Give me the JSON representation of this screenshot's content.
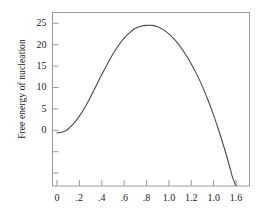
{
  "chart_data": {
    "type": "line",
    "title": "",
    "xlabel": "",
    "ylabel": "Free energy of nucleation",
    "xlim": [
      -0.04,
      1.72
    ],
    "ylim": [
      -13.0,
      27.5
    ],
    "grid": false,
    "legend": null,
    "x_ticks": [
      {
        "value": 0.0,
        "label": "0"
      },
      {
        "value": 0.2,
        "label": ".2"
      },
      {
        "value": 0.4,
        "label": ".4"
      },
      {
        "value": 0.6,
        "label": ".6"
      },
      {
        "value": 0.8,
        "label": ".8"
      },
      {
        "value": 1.0,
        "label": "1.0"
      },
      {
        "value": 1.2,
        "label": "1.2"
      },
      {
        "value": 1.4,
        "label": "1.0"
      },
      {
        "value": 1.6,
        "label": "1.6"
      }
    ],
    "y_ticks": [
      {
        "value": 25,
        "label": "25"
      },
      {
        "value": 20,
        "label": "20"
      },
      {
        "value": 15,
        "label": "15"
      },
      {
        "value": 10,
        "label": "10"
      },
      {
        "value": 5,
        "label": "5"
      },
      {
        "value": 0,
        "label": "0"
      },
      {
        "value": -5,
        "label": ""
      },
      {
        "value": -10,
        "label": ""
      }
    ],
    "series": [
      {
        "name": "free-energy-of-nucleation",
        "color": "#4a4a4a",
        "x": [
          0.0,
          0.05,
          0.1,
          0.15,
          0.2,
          0.25,
          0.3,
          0.35,
          0.4,
          0.45,
          0.5,
          0.55,
          0.6,
          0.65,
          0.7,
          0.75,
          0.8,
          0.85,
          0.9,
          0.95,
          1.0,
          1.05,
          1.1,
          1.15,
          1.2,
          1.25,
          1.3,
          1.35,
          1.4,
          1.45,
          1.5,
          1.55,
          1.57,
          1.6,
          1.62
        ],
        "y": [
          -0.6,
          -0.4,
          0.3,
          1.6,
          3.3,
          5.4,
          7.8,
          10.4,
          13.0,
          15.5,
          17.8,
          19.8,
          21.5,
          22.8,
          23.8,
          24.3,
          24.5,
          24.5,
          24.2,
          23.5,
          22.5,
          21.2,
          19.6,
          17.7,
          15.5,
          13.0,
          10.2,
          7.0,
          3.5,
          -0.4,
          -4.6,
          -9.2,
          -11.1,
          -13.0,
          -14.3
        ]
      }
    ],
    "annotations": {
      "peak_value": 24.5,
      "peak_x": 0.85,
      "zero_crossing_x": 1.44
    }
  },
  "axes": {
    "frame_color": "#9b9b9b",
    "tick_color": "#9b9b9b"
  }
}
